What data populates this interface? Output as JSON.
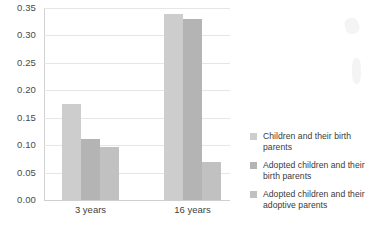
{
  "chart_data": {
    "type": "bar",
    "title": "",
    "xlabel": "",
    "ylabel": "",
    "categories": [
      "3 years",
      "16 years"
    ],
    "series": [
      {
        "name": "Children and their birth parents",
        "values": [
          0.175,
          0.34
        ],
        "color": "#cdcdcd"
      },
      {
        "name": "Adopted children and their birth parents",
        "values": [
          0.112,
          0.33
        ],
        "color": "#b4b4b4"
      },
      {
        "name": "Adopted children and their adoptive parents",
        "values": [
          0.097,
          0.07
        ],
        "color": "#c1c1c1"
      }
    ],
    "ylim": [
      0.0,
      0.35
    ],
    "ytick_values": [
      0.0,
      0.05,
      0.1,
      0.15,
      0.2,
      0.25,
      0.3,
      0.35
    ],
    "ytick_labels": [
      "0.00",
      "0.05",
      "0.10",
      "0.15",
      "0.20",
      "0.25",
      "0.30",
      "0.35"
    ],
    "grid": true,
    "legend_position": "right"
  },
  "axes": {
    "y_ticks": [
      {
        "label": "0.35",
        "value": 0.35
      },
      {
        "label": "0.30",
        "value": 0.3
      },
      {
        "label": "0.25",
        "value": 0.25
      },
      {
        "label": "0.20",
        "value": 0.2
      },
      {
        "label": "0.15",
        "value": 0.15
      },
      {
        "label": "0.10",
        "value": 0.1
      },
      {
        "label": "0.05",
        "value": 0.05
      },
      {
        "label": "0.00",
        "value": 0.0
      }
    ],
    "x_ticks": [
      {
        "label": "3 years"
      },
      {
        "label": "16 years"
      }
    ]
  },
  "legend": {
    "items": [
      {
        "label": "Children and their birth parents",
        "color": "#cdcdcd"
      },
      {
        "label": "Adopted children and their birth parents",
        "color": "#b4b4b4"
      },
      {
        "label": "Adopted children and their adoptive parents",
        "color": "#c1c1c1"
      }
    ]
  }
}
